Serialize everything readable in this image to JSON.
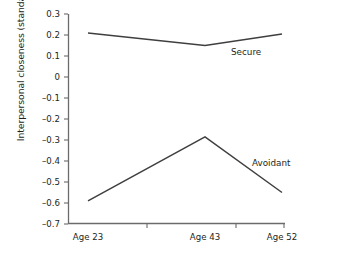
{
  "chart_data": {
    "type": "line",
    "title": "",
    "xlabel": "",
    "ylabel": "Interpersonal closeness (standard scores)",
    "categories": [
      "Age 23",
      "Age 43",
      "Age 52"
    ],
    "ylim": [
      -0.7,
      0.3
    ],
    "ytick_labels": [
      "0.3",
      "0.2",
      "0.1",
      "0",
      "–0.1",
      "–0.2",
      "–0.3",
      "–0.4",
      "–0.5",
      "–0.6",
      "–0.7"
    ],
    "ytick_values": [
      0.3,
      0.2,
      0.1,
      0,
      -0.1,
      -0.2,
      -0.3,
      -0.4,
      -0.5,
      -0.6,
      -0.7
    ],
    "grid": false,
    "legend_position": "inline-annotation",
    "line_color": "#3f3f3f",
    "series": [
      {
        "name": "Secure",
        "values": [
          0.21,
          0.15,
          0.205
        ],
        "label": "Secure"
      },
      {
        "name": "Avoidant",
        "values": [
          -0.59,
          -0.285,
          -0.55
        ],
        "label": "Avoidant"
      }
    ]
  }
}
